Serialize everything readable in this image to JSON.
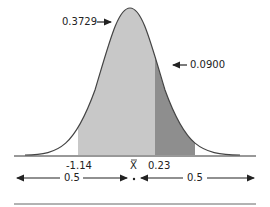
{
  "diagram": {
    "type": "normal-distribution-curve",
    "peak_label": "0.3729",
    "tail_label": "0.0900",
    "axis_labels": {
      "left": "-1.14",
      "center": "X",
      "right": "0.23"
    },
    "bottom_arrows": {
      "left_value": "0.5",
      "right_value": "0.5"
    },
    "colors": {
      "light_region": "#c8c8c8",
      "dark_region": "#8e8e8e",
      "curve": "#444444"
    }
  }
}
